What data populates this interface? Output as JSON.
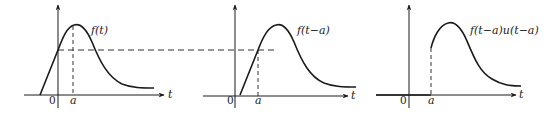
{
  "diagram": {
    "axis_label": "t",
    "origin_label": "0",
    "shift_label": "a",
    "panels": [
      {
        "id": "original",
        "curve_label": "f(t)"
      },
      {
        "id": "shifted",
        "curve_label": "f(t−a)"
      },
      {
        "id": "shifted-truncated",
        "curve_label": "f(t−a)u(t−a)"
      }
    ]
  },
  "colors": {
    "stroke": "#1a1a1a",
    "dash": "#333333",
    "background": "#ffffff"
  }
}
